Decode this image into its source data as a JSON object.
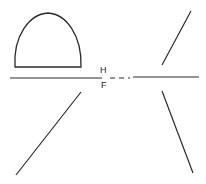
{
  "diagram": {
    "labels": {
      "top": "H",
      "bottom": "F"
    },
    "colors": {
      "stroke": "#2a2a2a",
      "background": "#ffffff"
    },
    "shapes": {
      "dome": "arch-shape (parabolic, closed base)",
      "horizon_line": "horizontal line with dashed center gap",
      "upper_right_line": "diagonal line",
      "lower_left_line": "diagonal line",
      "lower_right_line": "diagonal line"
    }
  }
}
